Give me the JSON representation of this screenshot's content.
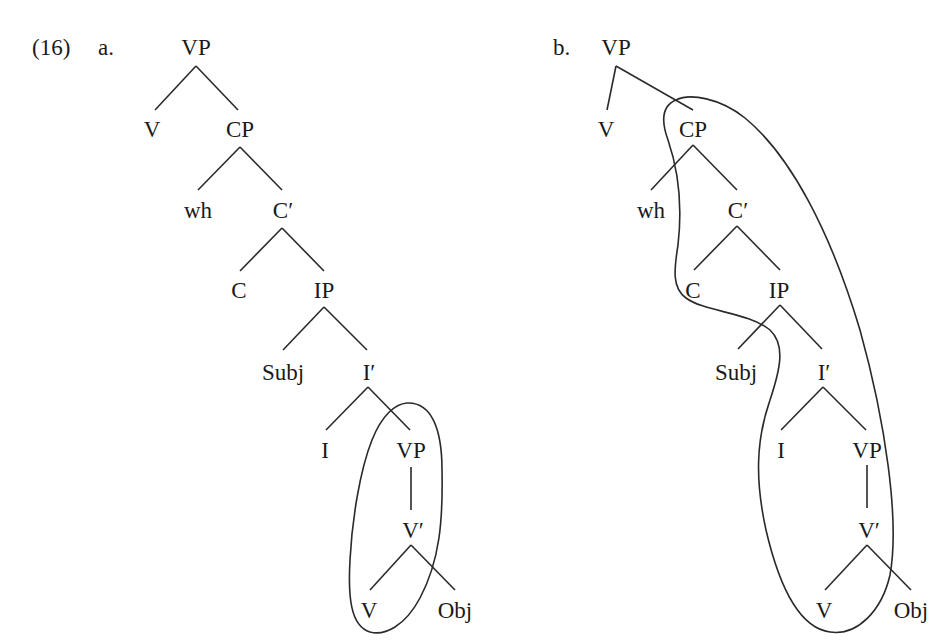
{
  "example": {
    "number": "(16)",
    "tree_a_label": "a.",
    "tree_b_label": "b."
  },
  "tree_a": {
    "nodes": [
      {
        "id": "VP",
        "label": "VP",
        "x": 196,
        "y": 47
      },
      {
        "id": "V",
        "label": "V",
        "x": 152,
        "y": 129
      },
      {
        "id": "CP",
        "label": "CP",
        "x": 240,
        "y": 129
      },
      {
        "id": "wh",
        "label": "wh",
        "x": 198,
        "y": 210
      },
      {
        "id": "Cbar",
        "label": "C′",
        "x": 283,
        "y": 210
      },
      {
        "id": "C",
        "label": "C",
        "x": 239,
        "y": 290
      },
      {
        "id": "IP",
        "label": "IP",
        "x": 324,
        "y": 290
      },
      {
        "id": "Subj",
        "label": "Subj",
        "x": 283,
        "y": 372
      },
      {
        "id": "Ibar",
        "label": "I′",
        "x": 369,
        "y": 372
      },
      {
        "id": "I",
        "label": "I",
        "x": 325,
        "y": 450
      },
      {
        "id": "VP2",
        "label": "VP",
        "x": 411,
        "y": 450
      },
      {
        "id": "Vbar",
        "label": "V′",
        "x": 413,
        "y": 530
      },
      {
        "id": "V2",
        "label": "V",
        "x": 369,
        "y": 610
      },
      {
        "id": "Obj",
        "label": "Obj",
        "x": 455,
        "y": 610
      }
    ]
  },
  "tree_b": {
    "nodes": [
      {
        "id": "VP",
        "label": "VP",
        "x": 616,
        "y": 47
      },
      {
        "id": "V",
        "label": "V",
        "x": 606,
        "y": 129
      },
      {
        "id": "CP",
        "label": "CP",
        "x": 693,
        "y": 129
      },
      {
        "id": "wh",
        "label": "wh",
        "x": 651,
        "y": 210
      },
      {
        "id": "Cbar",
        "label": "C′",
        "x": 738,
        "y": 210
      },
      {
        "id": "C",
        "label": "C",
        "x": 693,
        "y": 290
      },
      {
        "id": "IP",
        "label": "IP",
        "x": 779,
        "y": 290
      },
      {
        "id": "Subj",
        "label": "Subj",
        "x": 736,
        "y": 372
      },
      {
        "id": "Ibar",
        "label": "I′",
        "x": 824,
        "y": 372
      },
      {
        "id": "I",
        "label": "I",
        "x": 781,
        "y": 450
      },
      {
        "id": "VP2",
        "label": "VP",
        "x": 867,
        "y": 450
      },
      {
        "id": "Vbar",
        "label": "V′",
        "x": 869,
        "y": 530
      },
      {
        "id": "V2",
        "label": "V",
        "x": 824,
        "y": 610
      },
      {
        "id": "Obj",
        "label": "Obj",
        "x": 911,
        "y": 610
      }
    ]
  },
  "colors": {
    "ink": "#1a1a1a",
    "background": "#ffffff"
  }
}
